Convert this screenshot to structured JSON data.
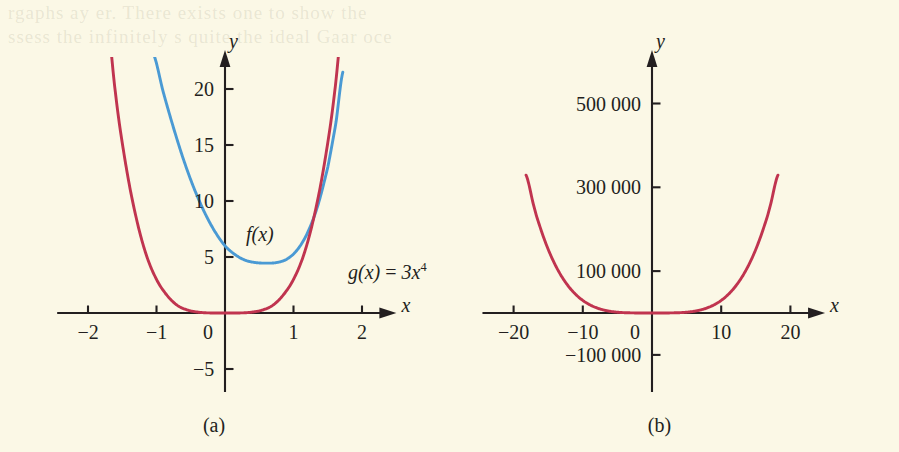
{
  "figure": {
    "background_color": "#fbf8e6",
    "ink_color": "#231f20",
    "curve_colors": {
      "f": "#4a9ad4",
      "g": "#c0344f"
    },
    "bleed_line_1": "rgaphs ay er.  There exists  one to show  the",
    "bleed_line_2": "ssess the infinitely  s  quite the ideal  Gaar  oce"
  },
  "panels": [
    {
      "id": "a",
      "caption": "(a)",
      "x_axis_label": "x",
      "y_axis_label": "y",
      "x_ticks": [
        {
          "value": -2,
          "label": "−2"
        },
        {
          "value": -1,
          "label": "−1"
        },
        {
          "value": 1,
          "label": "1"
        },
        {
          "value": 2,
          "label": "2"
        }
      ],
      "y_ticks": [
        {
          "value": -5,
          "label": "−5"
        },
        {
          "value": 5,
          "label": "5"
        },
        {
          "value": 10,
          "label": "10"
        },
        {
          "value": 15,
          "label": "15"
        },
        {
          "value": 20,
          "label": "20"
        }
      ],
      "origin_label": "0",
      "curve_labels": [
        {
          "text": "f(x)",
          "color": "#231f20"
        }
      ],
      "equations": [
        {
          "lhs": "g(x)",
          "op": "=",
          "coef": "3x",
          "exp": "4"
        }
      ]
    },
    {
      "id": "b",
      "caption": "(b)",
      "x_axis_label": "x",
      "y_axis_label": "y",
      "x_ticks": [
        {
          "value": -20,
          "label": "−20"
        },
        {
          "value": -10,
          "label": "−10"
        },
        {
          "value": 10,
          "label": "10"
        },
        {
          "value": 20,
          "label": "20"
        }
      ],
      "y_ticks": [
        {
          "value": -100000,
          "label": "−100 000"
        },
        {
          "value": 100000,
          "label": "100 000"
        },
        {
          "value": 300000,
          "label": "300 000"
        },
        {
          "value": 500000,
          "label": "500 000"
        }
      ],
      "origin_label": "0",
      "curve_labels": [],
      "equations": []
    }
  ],
  "chart_data": [
    {
      "type": "line",
      "panel": "a",
      "title": "",
      "xlabel": "x",
      "ylabel": "y",
      "xlim": [
        -2.4,
        2.4
      ],
      "ylim": [
        -8,
        24
      ],
      "xticks": [
        -2,
        -1,
        1,
        2
      ],
      "yticks": [
        -5,
        5,
        10,
        15,
        20
      ],
      "grid": false,
      "legend": "inline-annotations",
      "annotations": [
        {
          "text": "f(x)",
          "x": 0.35,
          "y": 7.2
        },
        {
          "text": "g(x) = 3x^4",
          "x": 1.85,
          "y": 3.4
        }
      ],
      "series": [
        {
          "name": "f(x)",
          "color": "#4a9ad4",
          "expression": "3x^4 - 16x^3 + 18x^2 + 5 (approx.)",
          "x": [
            -1.05,
            -0.9,
            -0.75,
            -0.6,
            -0.45,
            -0.3,
            -0.15,
            0,
            0.15,
            0.3,
            0.45,
            0.6,
            0.75,
            0.9,
            1.05,
            1.2,
            1.35,
            1.5,
            1.62,
            1.72
          ],
          "y": [
            23.2,
            19.7,
            16.5,
            13.6,
            11.1,
            9.0,
            7.3,
            6.0,
            5.2,
            4.7,
            4.5,
            4.45,
            4.5,
            4.8,
            5.6,
            7.1,
            9.5,
            13.0,
            17.0,
            21.5
          ]
        },
        {
          "name": "g(x) = 3x^4",
          "color": "#c0344f",
          "expression": "3x^4",
          "x": [
            -1.77,
            -1.6,
            -1.45,
            -1.3,
            -1.15,
            -1.0,
            -0.85,
            -0.7,
            -0.55,
            -0.4,
            -0.25,
            0,
            0.25,
            0.4,
            0.55,
            0.7,
            0.85,
            1.0,
            1.15,
            1.3,
            1.45,
            1.6,
            1.77
          ],
          "y": [
            29.4,
            19.7,
            13.3,
            8.6,
            5.2,
            3.0,
            1.6,
            0.7,
            0.27,
            0.08,
            0.01,
            0,
            0.01,
            0.08,
            0.27,
            0.7,
            1.6,
            3.0,
            5.2,
            8.6,
            13.3,
            19.7,
            29.4
          ]
        }
      ]
    },
    {
      "type": "line",
      "panel": "b",
      "title": "",
      "xlabel": "x",
      "ylabel": "y",
      "xlim": [
        -24,
        24
      ],
      "ylim": [
        -180000,
        620000
      ],
      "xticks": [
        -20,
        -10,
        10,
        20
      ],
      "yticks": [
        -100000,
        100000,
        300000,
        500000
      ],
      "grid": false,
      "legend": "none",
      "annotations": [],
      "series": [
        {
          "name": "g(x) = 3x^4",
          "color": "#c0344f",
          "expression": "3x^4",
          "x": [
            -18.2,
            -17,
            -16,
            -15,
            -14,
            -13,
            -12,
            -11,
            -10,
            -9,
            -8,
            -7,
            -6,
            -5,
            -4,
            -2,
            0,
            2,
            4,
            5,
            6,
            7,
            8,
            9,
            10,
            11,
            12,
            13,
            14,
            15,
            16,
            17,
            18.2
          ],
          "y": [
            329000,
            250563,
            196608,
            151875,
            115248,
            85683,
            62208,
            43923,
            30000,
            19683,
            12288,
            7203,
            3888,
            1875,
            768,
            48,
            0,
            48,
            768,
            1875,
            3888,
            7203,
            12288,
            19683,
            30000,
            43923,
            62208,
            85683,
            115248,
            151875,
            196608,
            250563,
            329000
          ]
        }
      ]
    }
  ]
}
